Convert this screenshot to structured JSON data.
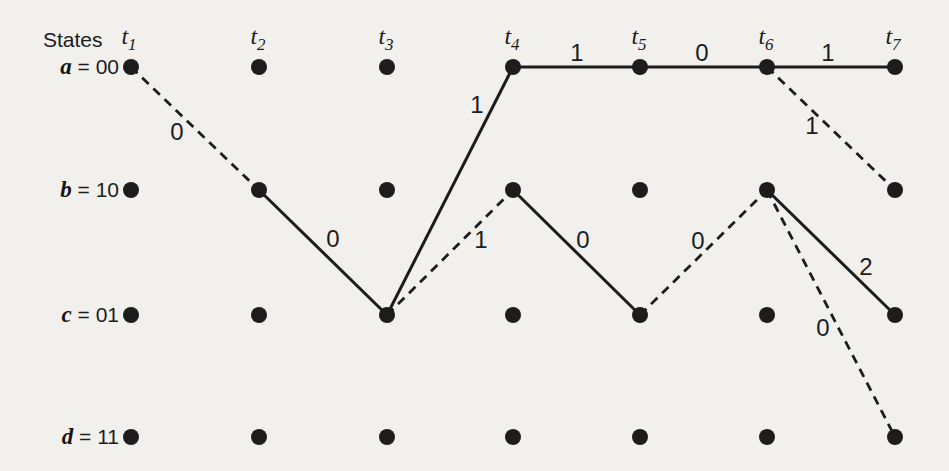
{
  "figure": {
    "kind": "trellis-diagram",
    "background_color": "#f1f0ed",
    "ink_color": "#1c1c1c"
  },
  "header": {
    "states_label": "States"
  },
  "time_steps": [
    {
      "base": "t",
      "sub": "1"
    },
    {
      "base": "t",
      "sub": "2"
    },
    {
      "base": "t",
      "sub": "3"
    },
    {
      "base": "t",
      "sub": "4"
    },
    {
      "base": "t",
      "sub": "5"
    },
    {
      "base": "t",
      "sub": "6"
    },
    {
      "base": "t",
      "sub": "7"
    }
  ],
  "states": [
    {
      "letter": "a",
      "eq": " = ",
      "bits": "00"
    },
    {
      "letter": "b",
      "eq": " = ",
      "bits": "10"
    },
    {
      "letter": "c",
      "eq": " = ",
      "bits": "01"
    },
    {
      "letter": "d",
      "eq": " = ",
      "bits": "11"
    }
  ],
  "edges": [
    {
      "from": "a-t1",
      "to": "b-t2",
      "style": "dashed",
      "label": "0"
    },
    {
      "from": "b-t2",
      "to": "c-t3",
      "style": "solid",
      "label": "0"
    },
    {
      "from": "c-t3",
      "to": "a-t4",
      "style": "solid",
      "label": "1"
    },
    {
      "from": "c-t3",
      "to": "b-t4",
      "style": "dashed",
      "label": "1"
    },
    {
      "from": "a-t4",
      "to": "a-t5",
      "style": "solid",
      "label": "1"
    },
    {
      "from": "b-t4",
      "to": "c-t5",
      "style": "solid",
      "label": "0"
    },
    {
      "from": "a-t5",
      "to": "a-t6",
      "style": "solid",
      "label": "0"
    },
    {
      "from": "c-t5",
      "to": "b-t6",
      "style": "dashed",
      "label": "0"
    },
    {
      "from": "a-t6",
      "to": "a-t7",
      "style": "solid",
      "label": "1"
    },
    {
      "from": "a-t6",
      "to": "b-t7",
      "style": "dashed",
      "label": "1"
    },
    {
      "from": "b-t6",
      "to": "c-t7",
      "style": "solid",
      "label": "2"
    },
    {
      "from": "b-t6",
      "to": "d-t7",
      "style": "dashed",
      "label": "0"
    }
  ]
}
